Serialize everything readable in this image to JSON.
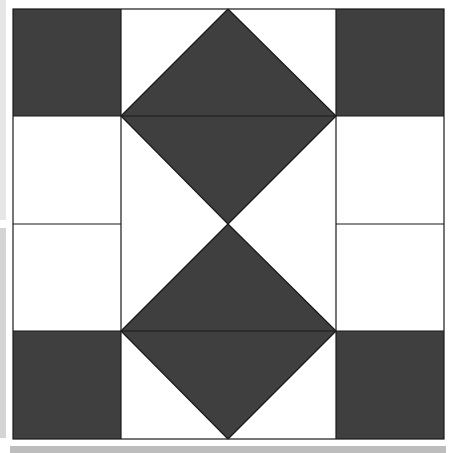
{
  "diagram": {
    "type": "quilt-block",
    "colors": {
      "dark": "#3f3f3f",
      "light": "#ffffff",
      "line": "#1a1a1a",
      "frame_strip": "#d8d8d8"
    },
    "grid": {
      "x": [
        13,
        121,
        228,
        336,
        444
      ],
      "y": [
        9,
        116,
        224,
        331,
        439
      ]
    }
  }
}
